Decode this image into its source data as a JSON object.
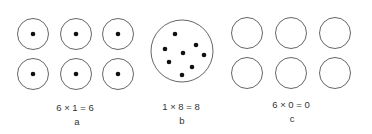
{
  "panels": [
    {
      "id": "a",
      "equation": "6 × 1 = 6",
      "label": "a",
      "circles": [
        [
          33,
          34
        ],
        [
          76,
          34
        ],
        [
          118,
          34
        ],
        [
          33,
          74
        ],
        [
          76,
          74
        ],
        [
          118,
          74
        ]
      ],
      "dots_per_circle": 1
    },
    {
      "id": "b",
      "equation": "1 × 8 = 8",
      "label": "b",
      "circle": [
        182,
        51
      ],
      "dots": [
        [
          175,
          34
        ],
        [
          165,
          49
        ],
        [
          183,
          53
        ],
        [
          196,
          45
        ],
        [
          204,
          55
        ],
        [
          169,
          62
        ],
        [
          192,
          67
        ],
        [
          182,
          75
        ]
      ]
    },
    {
      "id": "c",
      "equation": "6 × 0 = 0",
      "label": "c",
      "circles": [
        [
          247,
          33
        ],
        [
          291,
          33
        ],
        [
          335,
          33
        ],
        [
          247,
          73
        ],
        [
          291,
          73
        ],
        [
          335,
          73
        ]
      ],
      "dots_per_circle": 0
    }
  ],
  "colors": {
    "stroke": "#555555",
    "dot": "#111111",
    "text": "#333333"
  }
}
